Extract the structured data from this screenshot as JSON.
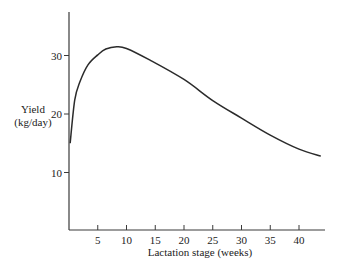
{
  "chart_data": {
    "type": "line",
    "title": "",
    "xlabel": "Lactation stage (weeks)",
    "ylabel_line1": "Yield",
    "ylabel_line2": "(kg/day)",
    "xlim": [
      0,
      44
    ],
    "ylim": [
      0,
      37
    ],
    "x_ticks": [
      5,
      10,
      15,
      20,
      25,
      30,
      35,
      40
    ],
    "y_ticks": [
      10,
      20,
      30
    ],
    "grid": false,
    "legend": null,
    "series": [
      {
        "name": "Lactation curve",
        "x": [
          0.2,
          1,
          1.9,
          3.3,
          5,
          6.4,
          8.3,
          10,
          14.1,
          20,
          25,
          30,
          35,
          40,
          43.8
        ],
        "y": [
          15,
          22.4,
          25.5,
          28.4,
          30.1,
          31.1,
          31.5,
          31.2,
          29.2,
          25.9,
          22.3,
          19.3,
          16.4,
          14.0,
          12.8
        ]
      }
    ],
    "layout": {
      "origin_px": [
        69,
        231
      ],
      "px_per_x": 5.75,
      "px_per_y": 5.85,
      "x_axis_end_px": 325,
      "y_axis_top_px": 12
    }
  }
}
